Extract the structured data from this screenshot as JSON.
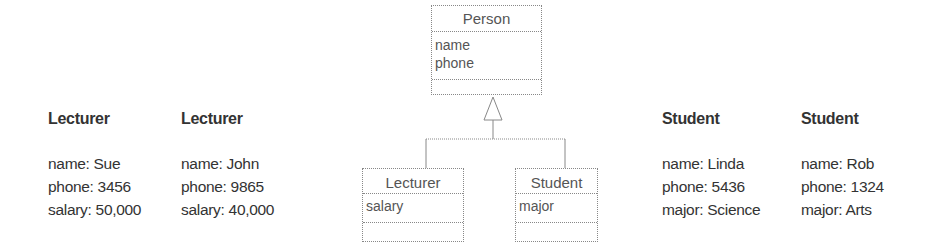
{
  "class_diagram": {
    "superclass": {
      "name": "Person",
      "attributes": [
        "name",
        "phone"
      ]
    },
    "subclasses": [
      {
        "name": "Lecturer",
        "attributes": [
          "salary"
        ]
      },
      {
        "name": "Student",
        "attributes": [
          "major"
        ]
      }
    ]
  },
  "instances": [
    {
      "class": "Lecturer",
      "fields": [
        "name: Sue",
        "phone: 3456",
        "salary: 50,000"
      ]
    },
    {
      "class": "Lecturer",
      "fields": [
        "name: John",
        "phone: 9865",
        "salary: 40,000"
      ]
    },
    {
      "class": "Student",
      "fields": [
        "name: Linda",
        "phone: 5436",
        "major: Science"
      ]
    },
    {
      "class": "Student",
      "fields": [
        "name: Rob",
        "phone: 1324",
        "major: Arts"
      ]
    }
  ],
  "colors": {
    "line": "#888888",
    "text": "#333333"
  }
}
